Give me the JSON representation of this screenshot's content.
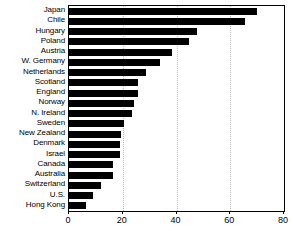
{
  "chart_data": {
    "type": "bar",
    "orientation": "horizontal",
    "title": "",
    "subtitle": "",
    "xlabel": "",
    "ylabel": "",
    "xlim": [
      0,
      80
    ],
    "xticks": [
      0,
      20,
      40,
      60,
      80
    ],
    "xtick_labels": [
      "0",
      "20",
      "40",
      "60",
      "80"
    ],
    "grid": true,
    "grid_axis": "x",
    "legend": false,
    "legend_position": "none",
    "bar_color": "#000000",
    "background_color": "#ffffff",
    "categories": [
      "Japan",
      "Chile",
      "Hungary",
      "Poland",
      "Austria",
      "W. Germany",
      "Netherlands",
      "Scotland",
      "England",
      "Norway",
      "N. Ireland",
      "Sweden",
      "New Zealand",
      "Denmark",
      "Israel",
      "Canada",
      "Australia",
      "Switzerland",
      "U.S.",
      "Hong Kong"
    ],
    "values": [
      70.0,
      65.5,
      47.5,
      44.5,
      38.5,
      34.0,
      28.5,
      25.5,
      25.5,
      24.0,
      23.5,
      20.5,
      19.5,
      19.0,
      19.0,
      16.5,
      16.5,
      12.0,
      9.0,
      6.5
    ]
  }
}
